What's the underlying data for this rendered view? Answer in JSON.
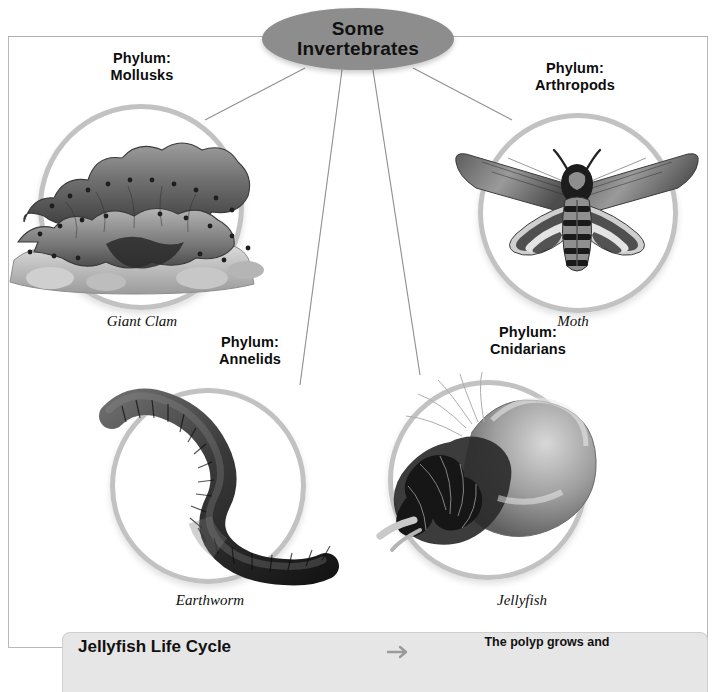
{
  "diagram": {
    "center": {
      "line1": "Some",
      "line2": "Invertebrates"
    },
    "nodes": [
      {
        "id": "mollusks",
        "phylum_label": "Phylum:\nMollusks",
        "caption": "Giant Clam",
        "organism": "giant-clam"
      },
      {
        "id": "arthropods",
        "phylum_label": "Phylum:\nArthropods",
        "caption": "Moth",
        "organism": "moth"
      },
      {
        "id": "annelids",
        "phylum_label": "Phylum:\nAnnelids",
        "caption": "Earthworm",
        "organism": "earthworm"
      },
      {
        "id": "cnidarians",
        "phylum_label": "Phylum:\nCnidarians",
        "caption": "Jellyfish",
        "organism": "jellyfish"
      }
    ]
  },
  "bottom_panel": {
    "title": "Jellyfish Life Cycle",
    "step_text": "The polyp grows and",
    "icon": "arrow-right-icon"
  },
  "colors": {
    "center_node_fill": "#8d8d8d",
    "ring_stroke": "#c2c2c2",
    "connector_line": "#8f8f8f",
    "frame_border": "#b9b9b9",
    "panel_fill": "#e6e6e6",
    "text": "#0d0d0d"
  }
}
